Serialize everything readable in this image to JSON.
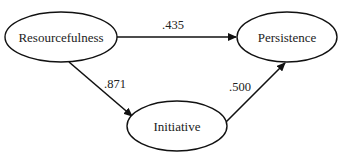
{
  "diagram": {
    "type": "path-diagram",
    "nodes": [
      {
        "id": "resourcefulness",
        "label": "Resourcefulness"
      },
      {
        "id": "persistence",
        "label": "Persistence"
      },
      {
        "id": "initiative",
        "label": "Initiative"
      }
    ],
    "edges": [
      {
        "from": "resourcefulness",
        "to": "persistence",
        "label": ".435"
      },
      {
        "from": "resourcefulness",
        "to": "initiative",
        "label": ".871"
      },
      {
        "from": "initiative",
        "to": "persistence",
        "label": ".500"
      }
    ]
  }
}
